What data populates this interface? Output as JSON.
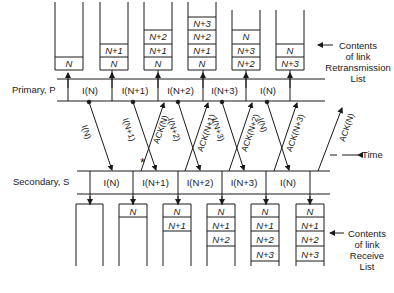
{
  "diagram": {
    "primary_label": "Primary, P",
    "secondary_label": "Secondary, S",
    "time_label": "Time",
    "retransmission_caption": [
      "Contents",
      "of link",
      "Retransmission",
      "List"
    ],
    "receive_caption": [
      "Contents",
      "of link",
      "Receive",
      "List"
    ],
    "primary_frames": [
      "I(N)",
      "I(N+1)",
      "I(N+2)",
      "I(N+3)",
      "I(N)"
    ],
    "secondary_frames": [
      "I(N)",
      "I(N+1)",
      "I(N+2)",
      "I(N+3)",
      "I(N)"
    ],
    "retransmission_stacks": [
      [
        "N"
      ],
      [
        "N",
        "N+1"
      ],
      [
        "N",
        "N+1",
        "N+2"
      ],
      [
        "N",
        "N+1",
        "N+2",
        "N+3"
      ],
      [
        "N+2",
        "N+3",
        "N"
      ],
      [
        "N+3",
        "N"
      ]
    ],
    "receive_stacks": [
      [],
      [
        "N"
      ],
      [
        "N",
        "N+1"
      ],
      [
        "N",
        "N+1",
        "N+2"
      ],
      [
        "N",
        "N+1",
        "N+2",
        "N+3"
      ],
      [
        "N",
        "N+1",
        "N+2",
        "N+3"
      ]
    ],
    "transmissions": [
      "I(N)",
      "I(N+1)",
      "I(N+2)",
      "I(N+3)",
      "I(N)"
    ],
    "acknowledgements": [
      "ACK(N)",
      "ACK(N+1)",
      "ACK(N+2)",
      "ACK(N+3)",
      "ACK(N)"
    ],
    "error_marker": "*"
  }
}
